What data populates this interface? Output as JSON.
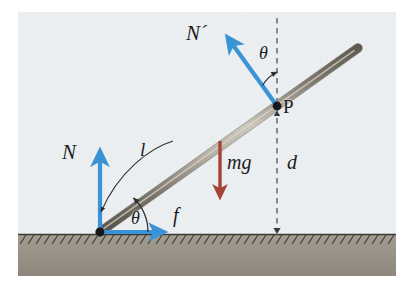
{
  "figure": {
    "width": 410,
    "height": 288
  },
  "colors": {
    "background": "#eef1f3",
    "page": "#ffffff",
    "ground_fill": "#9d9689",
    "ground_hatch": "#3a3a36",
    "rod_dark": "#6d675c",
    "rod_light": "#cfc9bd",
    "arrow_blue": "#3a93d6",
    "arrow_red": "#a54436",
    "dashed": "#55555a",
    "text": "#1b1b1b"
  },
  "labels": {
    "normal_wall": "N´",
    "theta_top": "θ",
    "point_p": "P",
    "normal_ground": "N",
    "length": "l",
    "weight": "mg",
    "distance": "d",
    "theta_bottom": "θ",
    "friction": "f"
  },
  "geometry": {
    "rod_bottom": [
      100,
      232
    ],
    "rod_top": [
      358,
      48
    ],
    "point_p": [
      277,
      106
    ],
    "dashed_line_x": 277,
    "dashed_top_y": 18,
    "ground_y": 234
  },
  "elements": {
    "rod": "rod",
    "ground": "hatched-ground",
    "pivot_dot": "pivot-point",
    "p_dot": "point-p-marker",
    "vector_N": "normal-force-ground-vector",
    "vector_Nprime": "normal-force-wall-vector",
    "vector_f": "friction-force-vector",
    "vector_mg": "weight-vector",
    "arc_theta_top": "angle-arc-top",
    "arc_theta_bottom": "angle-arc-bottom",
    "leader_l": "length-leader-line",
    "dashed_vertical": "vertical-reference-line"
  }
}
